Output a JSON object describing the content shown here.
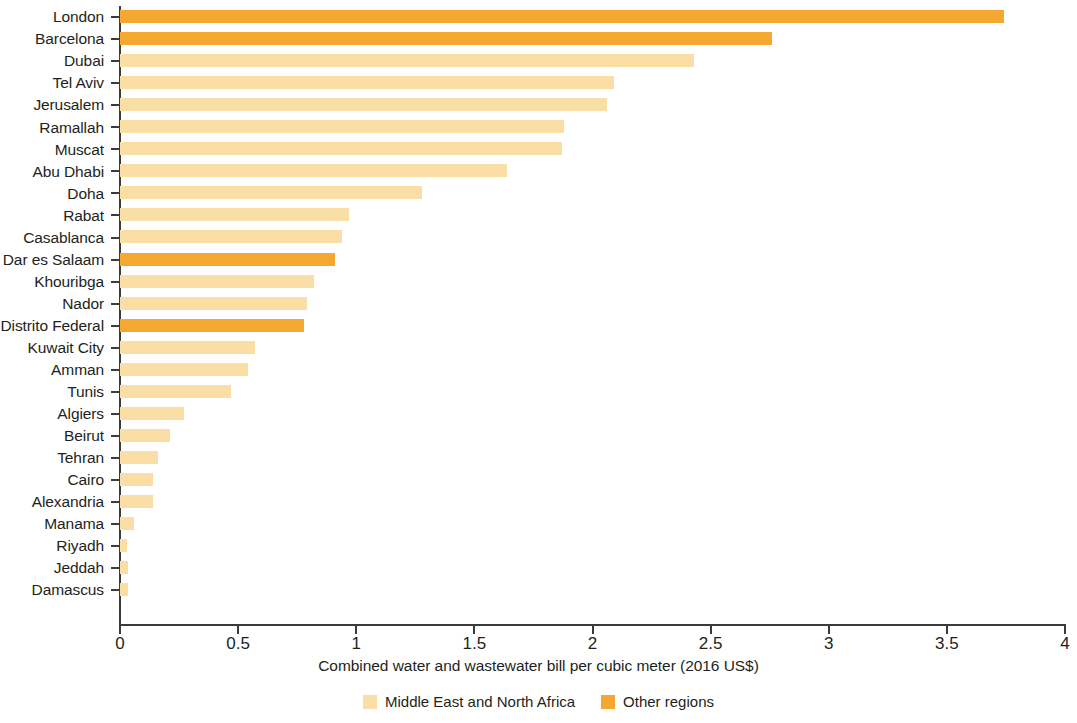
{
  "chart_data": {
    "type": "bar",
    "orientation": "horizontal",
    "title": "",
    "xlabel": "Combined water and wastewater bill per cubic meter (2016 US$)",
    "ylabel": "",
    "xlim": [
      0,
      4
    ],
    "xticks": [
      "0",
      "0.5",
      "1",
      "1.5",
      "2",
      "2.5",
      "3",
      "3.5",
      "4"
    ],
    "xtick_values": [
      0,
      0.5,
      1,
      1.5,
      2,
      2.5,
      3,
      3.5,
      4
    ],
    "grid": false,
    "legend_position": "bottom-center",
    "categories": [
      "London",
      "Barcelona",
      "Dubai",
      "Tel Aviv",
      "Jerusalem",
      "Ramallah",
      "Muscat",
      "Abu Dhabi",
      "Doha",
      "Rabat",
      "Casablanca",
      "Dar es Salaam",
      "Khouribga",
      "Nador",
      "Distrito Federal",
      "Kuwait City",
      "Amman",
      "Tunis",
      "Algiers",
      "Beirut",
      "Tehran",
      "Cairo",
      "Alexandria",
      "Manama",
      "Riyadh",
      "Jeddah",
      "Damascus"
    ],
    "values": [
      3.74,
      2.76,
      2.43,
      2.09,
      2.06,
      1.88,
      1.87,
      1.64,
      1.28,
      0.97,
      0.94,
      0.91,
      0.82,
      0.79,
      0.78,
      0.57,
      0.54,
      0.47,
      0.27,
      0.21,
      0.16,
      0.14,
      0.14,
      0.06,
      0.03,
      0.035,
      0.035
    ],
    "groups": [
      "other",
      "other",
      "mena",
      "mena",
      "mena",
      "mena",
      "mena",
      "mena",
      "mena",
      "mena",
      "mena",
      "other",
      "mena",
      "mena",
      "other",
      "mena",
      "mena",
      "mena",
      "mena",
      "mena",
      "mena",
      "mena",
      "mena",
      "mena",
      "mena",
      "mena",
      "mena"
    ],
    "series": [
      {
        "name": "Middle East and North Africa",
        "color": "#f9dfa6",
        "key": "mena"
      },
      {
        "name": "Other regions",
        "color": "#f5a831",
        "key": "other"
      }
    ],
    "colors": {
      "mena": "#f9dfa6",
      "other": "#f5a831",
      "axis": "#3b3b3b",
      "text": "#231f20",
      "background": "#ffffff"
    }
  },
  "legend": {
    "items": [
      {
        "label": "Middle East and North Africa",
        "color": "#f9dfa6"
      },
      {
        "label": "Other regions",
        "color": "#f5a831"
      }
    ]
  }
}
